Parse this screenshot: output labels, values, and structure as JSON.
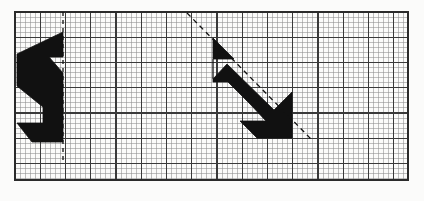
{
  "worksheet": {
    "title": "Reflection on grid paper",
    "description": "Two congruent black arrow-shaped polygons drawn on fine graph paper, each accompanied by a dashed line of reflection.",
    "background_color": "#fbfbfa",
    "shape_color": "#111111"
  },
  "grid": {
    "label": "graph-paper-grid",
    "x": 15,
    "y": 12,
    "width": 393,
    "height": 168,
    "minor_cell_px": 5.05,
    "major_every": 5,
    "minor_color": "#8c8c8c",
    "major_color": "#3a3a3a",
    "border_color": "#2b2b2b",
    "minor_width": 0.55,
    "major_width": 1.05,
    "border_width": 1.3,
    "minor_cols": 78,
    "minor_rows": 33
  },
  "shapes": [
    {
      "name": "left-arrow-polygon",
      "fill": "#111111",
      "points": "17,54 63,32 63,57 49,57 63,73 63,142 32,142 17,123 43,123 43,107 17,86"
    },
    {
      "name": "right-arrow-polygon",
      "fill": "#111111",
      "points": "213,38 234,59 213,59 213,79 227,64 274,110 292,92 292,138 257,138 240,121 266,121 250,104 228,82 213,82"
    }
  ],
  "mirror_lines": [
    {
      "name": "vertical-mirror-line",
      "x1": 63,
      "y1": 12,
      "x2": 63,
      "y2": 160,
      "color": "#111111",
      "width": 1.3,
      "dash": "4 4"
    },
    {
      "name": "diagonal-mirror-line",
      "x1": 187,
      "y1": 13,
      "x2": 311,
      "y2": 139,
      "color": "#111111",
      "width": 1.3,
      "dash": "5 4"
    }
  ]
}
